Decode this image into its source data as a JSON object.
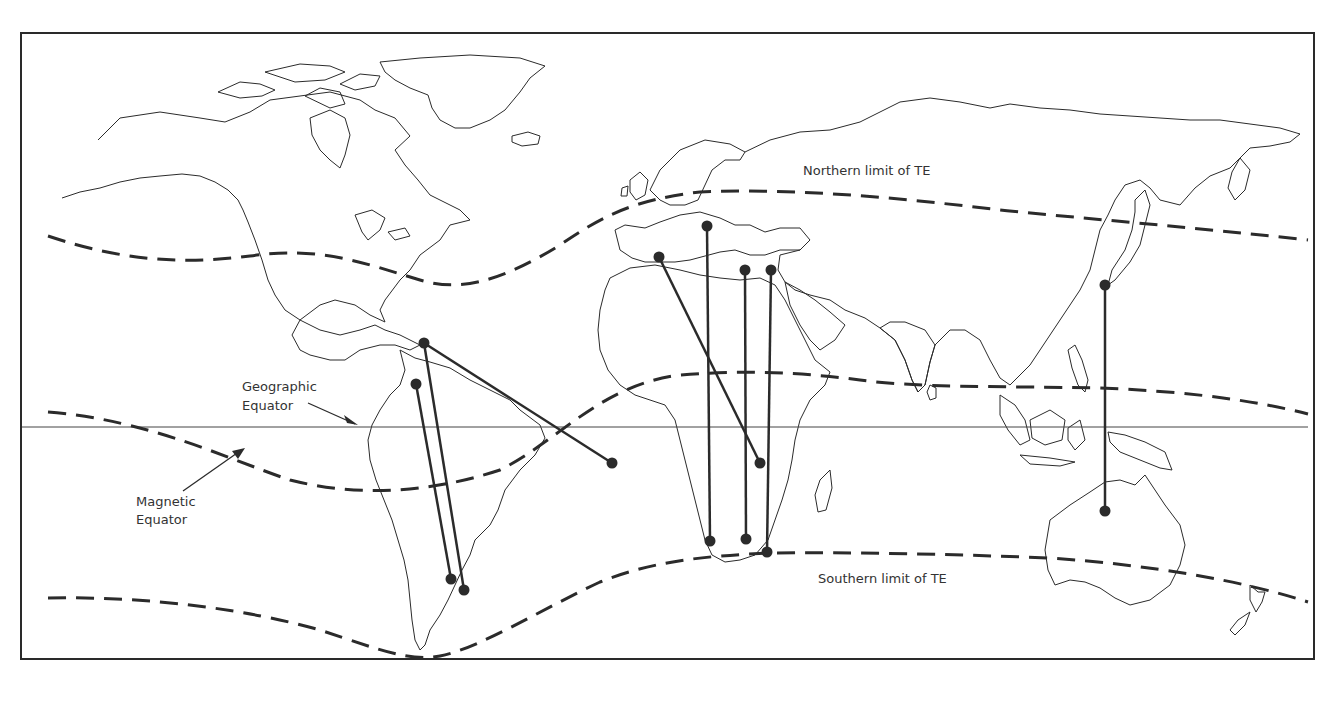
{
  "figure": {
    "labels": {
      "northern_limit": "Northern limit of TE",
      "southern_limit": "Southern limit of TE",
      "geographic_equator_line1": "Geographic",
      "geographic_equator_line2": "Equator",
      "magnetic_equator_line1": "Magnetic",
      "magnetic_equator_line2": "Equator"
    },
    "colors": {
      "ink": "#2b2b2b",
      "background": "#ffffff"
    },
    "curves": [
      {
        "name": "northern-limit-of-te",
        "style": "dashed"
      },
      {
        "name": "magnetic-equator",
        "style": "dashed"
      },
      {
        "name": "southern-limit-of-te",
        "style": "dashed"
      },
      {
        "name": "geographic-equator",
        "style": "solid-thin"
      }
    ],
    "propagation_paths": [
      {
        "id": "caribbean-to-south-america-1",
        "from": [
          416,
          384
        ],
        "to": [
          451,
          579
        ]
      },
      {
        "id": "caribbean-to-south-america-2",
        "from": [
          424,
          343
        ],
        "to": [
          464,
          590
        ]
      },
      {
        "id": "caribbean-to-atlantic",
        "from": [
          424,
          343
        ],
        "to": [
          612,
          463
        ]
      },
      {
        "id": "spain-to-east-africa",
        "from": [
          659,
          257
        ],
        "to": [
          760,
          463
        ]
      },
      {
        "id": "italy-to-southwest-africa",
        "from": [
          707,
          226
        ],
        "to": [
          710,
          541
        ]
      },
      {
        "id": "greece-to-south-africa",
        "from": [
          745,
          270
        ],
        "to": [
          746,
          539
        ]
      },
      {
        "id": "cyprus-to-south-africa",
        "from": [
          771,
          270
        ],
        "to": [
          767,
          552
        ]
      },
      {
        "id": "japan-to-australia",
        "from": [
          1105,
          285
        ],
        "to": [
          1105,
          511
        ]
      }
    ]
  }
}
